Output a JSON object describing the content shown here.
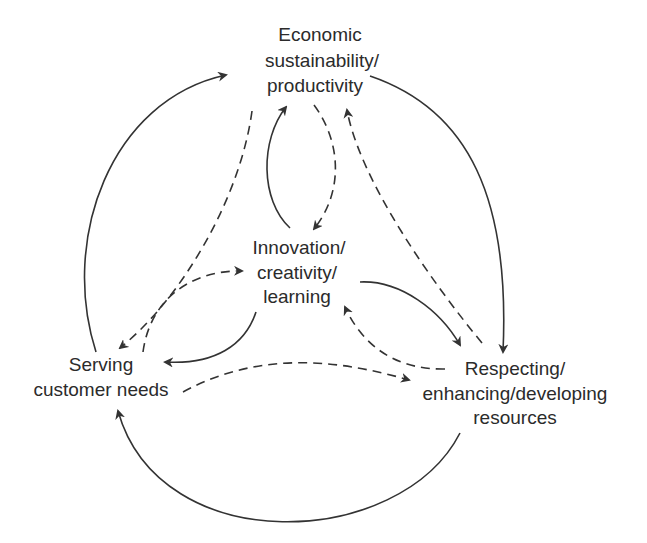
{
  "diagram": {
    "title": "",
    "nodes": [
      {
        "id": "economic",
        "lines": [
          "Economic",
          "sustainability/",
          "productivity"
        ]
      },
      {
        "id": "innovation",
        "lines": [
          "Innovation/",
          "creativity/",
          "learning"
        ]
      },
      {
        "id": "serving",
        "lines": [
          "Serving",
          "customer needs"
        ]
      },
      {
        "id": "respecting",
        "lines": [
          "Respecting/",
          "enhancing/developing",
          "resources"
        ]
      }
    ],
    "edges": [
      {
        "from": "serving",
        "to": "economic",
        "style": "solid"
      },
      {
        "from": "economic",
        "to": "respecting",
        "style": "solid"
      },
      {
        "from": "respecting",
        "to": "serving",
        "style": "solid"
      },
      {
        "from": "economic",
        "to": "serving",
        "style": "dashed"
      },
      {
        "from": "respecting",
        "to": "economic",
        "style": "dashed"
      },
      {
        "from": "serving",
        "to": "respecting",
        "style": "dashed"
      },
      {
        "from": "innovation",
        "to": "economic",
        "style": "solid"
      },
      {
        "from": "economic",
        "to": "innovation",
        "style": "dashed"
      },
      {
        "from": "innovation",
        "to": "serving",
        "style": "solid"
      },
      {
        "from": "serving",
        "to": "innovation",
        "style": "dashed"
      },
      {
        "from": "innovation",
        "to": "respecting",
        "style": "solid"
      },
      {
        "from": "respecting",
        "to": "innovation",
        "style": "dashed"
      }
    ],
    "colors": {
      "line": "#333333",
      "text": "#2b2b2b",
      "background": "#ffffff"
    }
  }
}
